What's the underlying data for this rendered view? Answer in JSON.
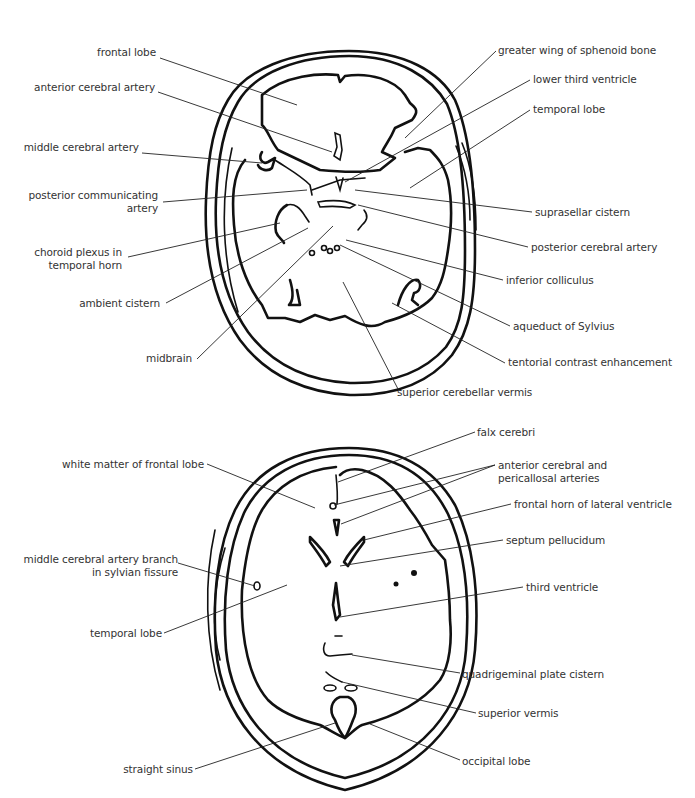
{
  "figure": {
    "panels": [
      {
        "name": "upper-axial-slice",
        "labels_left": [
          {
            "id": "frontal-lobe",
            "text": "frontal lobe",
            "x": 50,
            "y": 53
          },
          {
            "id": "anterior-cerebral-artery",
            "text": "anterior cerebral artery",
            "x": 45,
            "y": 88
          },
          {
            "id": "middle-cerebral-artery",
            "text": "middle cerebral artery",
            "x": 35,
            "y": 148
          },
          {
            "id": "posterior-communicating-artery",
            "text": "posterior communicating\nartery",
            "x": 40,
            "y": 193
          },
          {
            "id": "choroid-plexus",
            "text": "choroid plexus in\ntemporal horn",
            "x": 40,
            "y": 249
          },
          {
            "id": "ambient-cistern",
            "text": "ambient cistern",
            "x": 88,
            "y": 299
          },
          {
            "id": "midbrain",
            "text": "midbrain",
            "x": 147,
            "y": 354
          }
        ],
        "labels_right": [
          {
            "id": "greater-wing-sphenoid",
            "text": "greater wing of sphenoid bone",
            "x": 498,
            "y": 45
          },
          {
            "id": "lower-third-ventricle",
            "text": "lower third ventricle",
            "x": 533,
            "y": 74
          },
          {
            "id": "temporal-lobe-upper",
            "text": "temporal lobe",
            "x": 533,
            "y": 104
          },
          {
            "id": "suprasellar-cistern",
            "text": "suprasellar cistern",
            "x": 535,
            "y": 207
          },
          {
            "id": "posterior-cerebral-artery",
            "text": "posterior cerebral artery",
            "x": 531,
            "y": 242
          },
          {
            "id": "inferior-colliculus",
            "text": "inferior colliculus",
            "x": 506,
            "y": 275
          },
          {
            "id": "aqueduct-of-sylvius",
            "text": "aqueduct of Sylvius",
            "x": 513,
            "y": 321
          },
          {
            "id": "tentorial-contrast",
            "text": "tentorial contrast enhancement",
            "x": 508,
            "y": 357
          },
          {
            "id": "superior-cerebellar-vermis",
            "text": "superior cerebellar vermis",
            "x": 397,
            "y": 387
          }
        ]
      },
      {
        "name": "lower-axial-slice",
        "labels_left": [
          {
            "id": "white-matter-frontal",
            "text": "white matter of frontal lobe",
            "x": 77,
            "y": 459
          },
          {
            "id": "mca-branch-sylvian",
            "text": "middle cerebral artery branch\nin sylvian fissure",
            "x": 38,
            "y": 554
          },
          {
            "id": "temporal-lobe-lower",
            "text": "temporal lobe",
            "x": 96,
            "y": 627
          },
          {
            "id": "straight-sinus",
            "text": "straight sinus",
            "x": 140,
            "y": 764
          }
        ],
        "labels_right": [
          {
            "id": "falx-cerebri",
            "text": "falx cerebri",
            "x": 477,
            "y": 427
          },
          {
            "id": "anterior-cerebral-pericallosal",
            "text": "anterior cerebral and\npericallosal arteries",
            "x": 498,
            "y": 460
          },
          {
            "id": "frontal-horn-lateral-ventricle",
            "text": "frontal horn of lateral ventricle",
            "x": 514,
            "y": 499
          },
          {
            "id": "septum-pellucidum",
            "text": "septum pellucidum",
            "x": 506,
            "y": 535
          },
          {
            "id": "third-ventricle",
            "text": "third ventricle",
            "x": 526,
            "y": 582
          },
          {
            "id": "quadrigeminal-plate-cistern",
            "text": "quadrigeminal plate cistern",
            "x": 462,
            "y": 669
          },
          {
            "id": "superior-vermis",
            "text": "superior vermis",
            "x": 478,
            "y": 708
          },
          {
            "id": "occipital-lobe",
            "text": "occipital lobe",
            "x": 462,
            "y": 756
          }
        ]
      }
    ],
    "colors": {
      "line": "#111111",
      "text": "#333333",
      "background": "#ffffff"
    }
  }
}
